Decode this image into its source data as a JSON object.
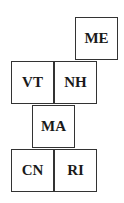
{
  "diagram": {
    "title": "",
    "cells": [
      {
        "label": "ME",
        "x": 75,
        "y": 17
      },
      {
        "label": "VT",
        "x": 11,
        "y": 61
      },
      {
        "label": "NH",
        "x": 54,
        "y": 61
      },
      {
        "label": "MA",
        "x": 32,
        "y": 105
      },
      {
        "label": "CN",
        "x": 11,
        "y": 149
      },
      {
        "label": "RI",
        "x": 54,
        "y": 149
      }
    ]
  }
}
